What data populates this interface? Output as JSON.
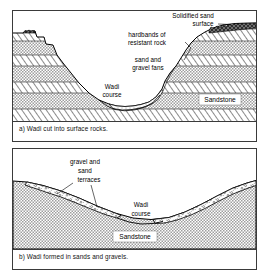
{
  "figure": {
    "panels": [
      {
        "id": "a",
        "caption": "a) Wadi cut into surface rocks.",
        "labels": {
          "solidified_surface": "Solidified sand",
          "solidified_surface_line2": "surface",
          "hardbands_line1": "hardbands of",
          "hardbands_line2": "resistant rock",
          "fans_line1": "sand and",
          "fans_line2": "gravel fans",
          "wadi_line1": "Wadi",
          "wadi_line2": "course",
          "sandstone": "Sandstone"
        }
      },
      {
        "id": "b",
        "caption": "b) Wadi formed in sands and gravels.",
        "labels": {
          "terraces_line1": "gravel and",
          "terraces_line2": "sand",
          "terraces_line3": "terraces",
          "wadi_line1": "Wadi",
          "wadi_line2": "course",
          "sandstone": "Sandstone"
        }
      }
    ]
  },
  "colors": {
    "ink": "#000000",
    "frame": "#3a3a3a",
    "stipple_gray": "#b9b9b9",
    "hatch_gray": "#ffffff",
    "crust_dark": "#4a4a4a",
    "paper": "#ffffff"
  }
}
